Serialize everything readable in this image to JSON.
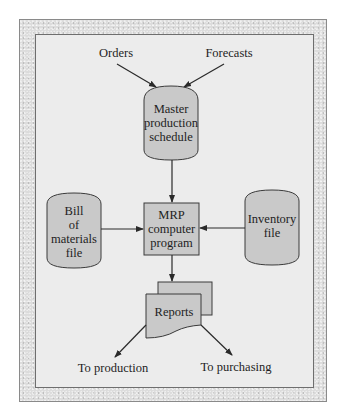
{
  "figure": {
    "inputs": {
      "orders": "Orders",
      "forecasts": "Forecasts"
    },
    "master_schedule": {
      "lines": [
        "Master",
        "production",
        "schedule"
      ]
    },
    "bill_of_materials": {
      "lines": [
        "Bill",
        "of",
        "materials",
        "file"
      ]
    },
    "mrp_program": {
      "lines": [
        "MRP",
        "computer",
        "program"
      ]
    },
    "inventory_file": {
      "lines": [
        "Inventory",
        "file"
      ]
    },
    "reports": {
      "label": "Reports"
    },
    "outputs": {
      "production": "To production",
      "purchasing": "To purchasing"
    },
    "colors": {
      "shape_fill": "#c9c9c9",
      "panel_bg": "#ececec",
      "frame_bg": "#dcdcdc",
      "stroke": "#3a3a3a"
    }
  }
}
